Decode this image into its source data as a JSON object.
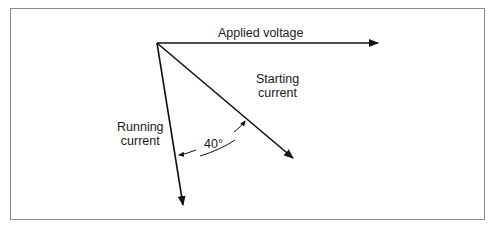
{
  "diagram": {
    "type": "phasor",
    "vectors": [
      {
        "name": "applied_voltage",
        "label": "Applied voltage"
      },
      {
        "name": "starting_current",
        "label_line1": "Starting",
        "label_line2": "current"
      },
      {
        "name": "running_current",
        "label_line1": "Running",
        "label_line2": "current"
      }
    ],
    "angle_label": "40°"
  }
}
